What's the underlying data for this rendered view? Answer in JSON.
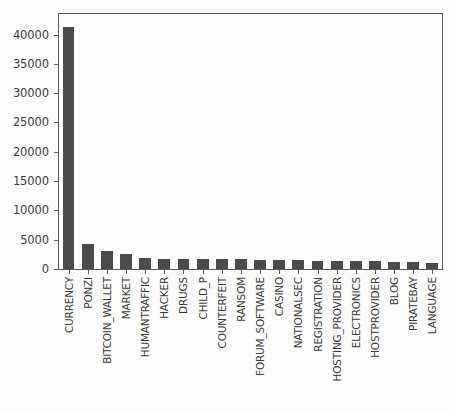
{
  "chart_data": {
    "type": "bar",
    "title": "",
    "subtitle": "",
    "xlabel": "",
    "ylabel": "",
    "grid": false,
    "legend": null,
    "legend_position": "none",
    "bar_color": "#4b4b4b",
    "background_color": "#fdfdfd",
    "axis_color": "#5a5a5a",
    "ylim": [
      0,
      43500
    ],
    "yticks": [
      0,
      5000,
      10000,
      15000,
      20000,
      25000,
      30000,
      35000,
      40000
    ],
    "ytick_labels": [
      "0",
      "5000",
      "10000",
      "15000",
      "20000",
      "25000",
      "30000",
      "35000",
      "40000"
    ],
    "xtick_rotation": -90,
    "categories": [
      "CURRENCY",
      "PONZI",
      "BITCOIN_WALLET",
      "MARKET",
      "HUMANTRAFFIC",
      "HACKER",
      "DRUGS",
      "CHILD_P",
      "COUNTERFEIT",
      "RANSOM",
      "FORUM_SOFTWARE",
      "CASINO",
      "NATIONALSEC",
      "REGISTRATION",
      "HOSTING_PROVIDER",
      "ELECTRONICS",
      "HOSTPROVIDER",
      "BLOG",
      "PIRATEBAY",
      "LANGUAGE"
    ],
    "values": [
      41200,
      4250,
      3050,
      2550,
      1800,
      1780,
      1750,
      1740,
      1700,
      1690,
      1600,
      1580,
      1570,
      1350,
      1330,
      1320,
      1300,
      1250,
      1230,
      1050
    ]
  }
}
